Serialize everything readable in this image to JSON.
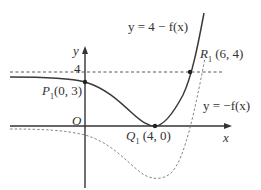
{
  "diagram": {
    "axes": {
      "x_label": "x",
      "y_label": "y",
      "origin_label": "O",
      "y_tick_label": "4"
    },
    "curves": [
      {
        "name": "solid-curve",
        "label": "y = 4 − f(x)",
        "style": "solid"
      },
      {
        "name": "dashed-curve",
        "label": "y = −f(x)",
        "style": "dashed"
      }
    ],
    "points": [
      {
        "name": "P",
        "sub": "1",
        "coords": "(0, 3)"
      },
      {
        "name": "Q",
        "sub": "1",
        "coords": "(4, 0)"
      },
      {
        "name": "R",
        "sub": "1",
        "coords": "(6, 4)"
      }
    ],
    "asymptote": {
      "label": "y = 4",
      "style": "dashed"
    },
    "colors": {
      "curve": "#3a3a3a",
      "dashed": "#777777",
      "axis": "#333333"
    }
  }
}
